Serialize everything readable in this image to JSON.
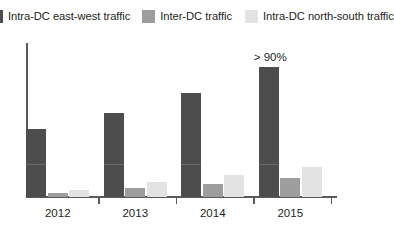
{
  "legend": {
    "items": [
      {
        "label": "Intra-DC east-west traffic",
        "color": "#4d4d4d",
        "icon": "legend-swatch-icon"
      },
      {
        "label": "Inter-DC traffic",
        "color": "#9d9d9d",
        "icon": "legend-swatch-icon"
      },
      {
        "label": "Intra-DC north-south traffic",
        "color": "#e3e3e3",
        "icon": "legend-swatch-icon"
      }
    ]
  },
  "annotations": {
    "peak_label": "> 90%"
  },
  "axis": {
    "tick_labels": [
      "2012",
      "2013",
      "2014",
      "2015"
    ]
  },
  "chart_data": {
    "type": "bar",
    "title": "",
    "xlabel": "",
    "ylabel": "",
    "categories": [
      "2012",
      "2013",
      "2014",
      "2015"
    ],
    "ylim": [
      0,
      100
    ],
    "grid": false,
    "legend_position": "top",
    "units": "percent of total data center traffic",
    "series": [
      {
        "name": "Intra-DC east-west traffic",
        "color": "#4d4d4d",
        "values": [
          46,
          57,
          70,
          88
        ]
      },
      {
        "name": "Inter-DC traffic",
        "color": "#9d9d9d",
        "values": [
          3,
          6,
          9,
          13
        ]
      },
      {
        "name": "Intra-DC north-south traffic",
        "color": "#e3e3e3",
        "values": [
          5,
          10,
          15,
          20
        ]
      }
    ],
    "annotations": [
      {
        "text": "> 90%",
        "series": "Intra-DC east-west traffic",
        "category": "2015"
      }
    ]
  }
}
